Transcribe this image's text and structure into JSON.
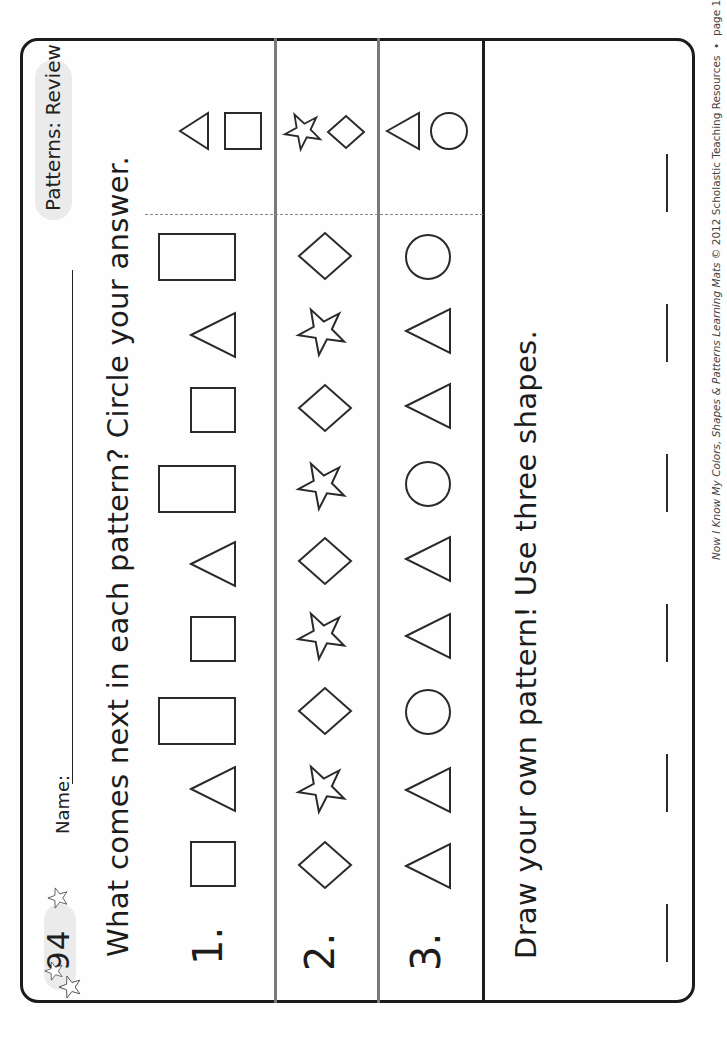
{
  "header": {
    "page_number": "94",
    "name_label": "Name:",
    "title": "Patterns: Review"
  },
  "instruction": "What comes next in each pattern? Circle your answer.",
  "rows": [
    {
      "number": "1.",
      "pattern": [
        "square",
        "triangle",
        "rectangle",
        "square",
        "triangle",
        "rectangle",
        "square",
        "triangle",
        "rectangle"
      ],
      "choices": [
        "triangle",
        "square"
      ]
    },
    {
      "number": "2.",
      "pattern": [
        "diamond",
        "star",
        "diamond",
        "star",
        "diamond",
        "star",
        "diamond",
        "star",
        "diamond"
      ],
      "choices": [
        "star",
        "diamond"
      ]
    },
    {
      "number": "3.",
      "pattern": [
        "triangle",
        "triangle",
        "circle",
        "triangle",
        "triangle",
        "circle",
        "triangle",
        "triangle",
        "circle"
      ],
      "choices": [
        "triangle",
        "circle"
      ]
    }
  ],
  "draw_section": {
    "instruction": "Draw your own pattern! Use three shapes.",
    "blank_count": 6
  },
  "footer": {
    "book_title": "Now I Know My Colors, Shapes & Patterns Learning Mats",
    "copyright": "© 2012  Scholastic Teaching Resources",
    "separator": "•",
    "page_ref": "page 102"
  },
  "colors": {
    "ink": "#1c1c1c",
    "divider_gray": "#7a7a7a",
    "pill_gray": "#ebebeb"
  }
}
